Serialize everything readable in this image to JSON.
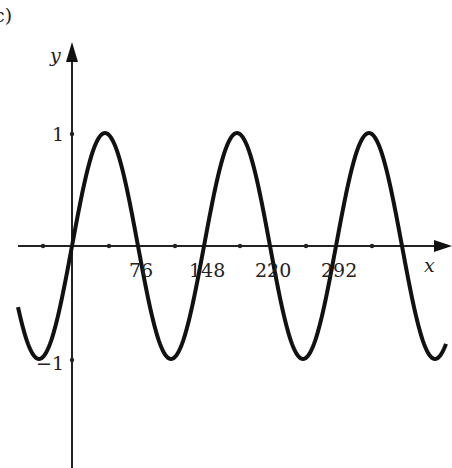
{
  "chart_data": {
    "type": "line",
    "title": "",
    "panel_label": "c)",
    "xlabel": "x",
    "ylabel": "y",
    "x_tick_labels": [
      "76",
      "148",
      "220",
      "292"
    ],
    "y_tick_labels": [
      "1",
      "−1"
    ],
    "ylim": [
      -1.9,
      1.9
    ],
    "xlim": [
      -55,
      390
    ],
    "grid": false,
    "series": [
      {
        "name": "y = sin(2πx/144)",
        "function": "sin",
        "amplitude": 1,
        "period": 144,
        "x": [
          -54,
          -36,
          0,
          36,
          72,
          108,
          144,
          180,
          216,
          252,
          288,
          324,
          360,
          388
        ],
        "values": [
          -0.71,
          -1,
          0,
          1,
          0,
          -1,
          0,
          1,
          0,
          -1,
          0,
          1,
          0,
          -0.93
        ]
      }
    ],
    "color": "#111111"
  },
  "labels": {
    "panel": "c)",
    "x_axis": "x",
    "y_axis": "y",
    "y_one": "1",
    "y_neg_one": "−1",
    "x_ticks": [
      "76",
      "148",
      "220",
      "292"
    ]
  }
}
